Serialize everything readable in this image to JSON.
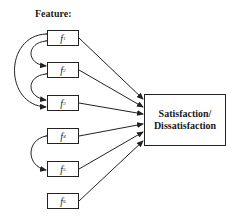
{
  "title": "Feature:",
  "features": [
    {
      "id": "f1",
      "base": "f",
      "sub": "1"
    },
    {
      "id": "f2",
      "base": "f",
      "sub": "2"
    },
    {
      "id": "f3",
      "base": "f",
      "sub": "3"
    },
    {
      "id": "f4",
      "base": "f",
      "sub": "4"
    },
    {
      "id": "f5",
      "base": "f",
      "sub": "5"
    },
    {
      "id": "f6",
      "base": "f",
      "sub": "6"
    }
  ],
  "target": {
    "line1": "Satisfaction/",
    "line2": "Dissatisfaction"
  },
  "correlations": [
    {
      "from": "f1",
      "to": "f2"
    },
    {
      "from": "f2",
      "to": "f3"
    },
    {
      "from": "f1",
      "to": "f3"
    },
    {
      "from": "f4",
      "to": "f5"
    }
  ],
  "edges": [
    {
      "from": "f1",
      "to": "target"
    },
    {
      "from": "f2",
      "to": "target"
    },
    {
      "from": "f3",
      "to": "target"
    },
    {
      "from": "f4",
      "to": "target"
    },
    {
      "from": "f5",
      "to": "target"
    },
    {
      "from": "f6",
      "to": "target"
    }
  ],
  "colors": {
    "line": "#222222",
    "background": "#ffffff"
  }
}
